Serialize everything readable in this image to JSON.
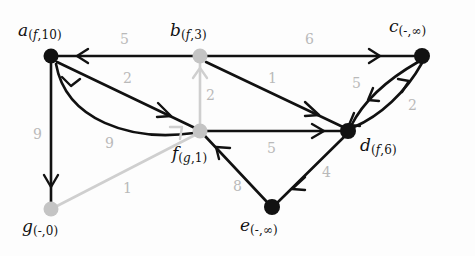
{
  "figure": {
    "type": "directed-weighted-graph",
    "background_color": "#fdfdfd",
    "colors": {
      "node_visited": "#111111",
      "node_unvisited": "#c4c4c4",
      "edge_active": "#111111",
      "edge_inactive": "#cfcfcf",
      "weight_label": "#b9b9b9"
    }
  },
  "nodes": [
    {
      "id": "a",
      "name": "a",
      "predecessor": "f",
      "distance": "10",
      "label": "a(f,10)",
      "x": 51,
      "y": 56,
      "color": "#111111",
      "label_x": 18,
      "label_y": 22
    },
    {
      "id": "b",
      "name": "b",
      "predecessor": "f",
      "distance": "3",
      "label": "b(f,3)",
      "x": 200,
      "y": 56,
      "color": "#c4c4c4",
      "label_x": 170,
      "label_y": 22
    },
    {
      "id": "c",
      "name": "c",
      "predecessor": "-",
      "distance": "∞",
      "label": "c(-,∞)",
      "x": 422,
      "y": 56,
      "color": "#111111",
      "label_x": 389,
      "label_y": 18
    },
    {
      "id": "d",
      "name": "d",
      "predecessor": "f",
      "distance": "6",
      "label": "d(f,6)",
      "x": 348,
      "y": 131,
      "color": "#111111",
      "label_x": 360,
      "label_y": 137
    },
    {
      "id": "e",
      "name": "e",
      "predecessor": "-",
      "distance": "∞",
      "label": "e(-,∞)",
      "x": 272,
      "y": 207,
      "color": "#111111",
      "label_x": 240,
      "label_y": 217
    },
    {
      "id": "f",
      "name": "f",
      "predecessor": "g",
      "distance": "1",
      "label": "f(g,1)",
      "x": 200,
      "y": 131,
      "color": "#c4c4c4",
      "label_x": 172,
      "label_y": 145
    },
    {
      "id": "g",
      "name": "g",
      "predecessor": "-",
      "distance": "0",
      "label": "g(-,0)",
      "x": 51,
      "y": 209,
      "color": "#c4c4c4",
      "label_x": 22,
      "label_y": 218
    }
  ],
  "edges": [
    {
      "from": "b",
      "to": "a",
      "weight": "5",
      "color": "#111111",
      "label_x": 120,
      "label_y": 32
    },
    {
      "from": "b",
      "to": "c",
      "weight": "6",
      "color": "#111111",
      "label_x": 305,
      "label_y": 32
    },
    {
      "from": "a",
      "to": "f",
      "weight": "2",
      "color": "#111111",
      "label_x": 123,
      "label_y": 71,
      "style": "straight"
    },
    {
      "from": "a",
      "to": "f",
      "weight": "9",
      "color": "#111111",
      "label_x": 105,
      "label_y": 136,
      "style": "curved"
    },
    {
      "from": "a",
      "to": "g",
      "weight": "9",
      "color": "#111111",
      "label_x": 33,
      "label_y": 127
    },
    {
      "from": "f",
      "to": "b",
      "weight": "2",
      "color": "#cfcfcf",
      "label_x": 206,
      "label_y": 88
    },
    {
      "from": "b",
      "to": "d",
      "weight": "1",
      "color": "#111111",
      "label_x": 268,
      "label_y": 71
    },
    {
      "from": "c",
      "to": "d",
      "weight": "5",
      "color": "#111111",
      "label_x": 352,
      "label_y": 76
    },
    {
      "from": "d",
      "to": "c",
      "weight": "2",
      "color": "#111111",
      "label_x": 408,
      "label_y": 98
    },
    {
      "from": "f",
      "to": "d",
      "weight": "5",
      "color": "#111111",
      "label_x": 267,
      "label_y": 141
    },
    {
      "from": "d",
      "to": "e",
      "weight": "4",
      "color": "#111111",
      "label_x": 322,
      "label_y": 165
    },
    {
      "from": "e",
      "to": "f",
      "weight": "8",
      "color": "#111111",
      "label_x": 233,
      "label_y": 179
    },
    {
      "from": "g",
      "to": "f",
      "weight": "1",
      "color": "#cfcfcf",
      "label_x": 123,
      "label_y": 181
    }
  ]
}
